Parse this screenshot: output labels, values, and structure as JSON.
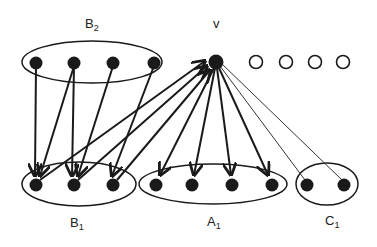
{
  "diagram": {
    "type": "directed-graph",
    "colors": {
      "stroke": "#1a1a1a",
      "filled_node": "#1a1a1a",
      "open_node": "#ffffff",
      "background": "#ffffff"
    },
    "labels": {
      "v": "v",
      "B2": {
        "base": "B",
        "sub": "2"
      },
      "B1": {
        "base": "B",
        "sub": "1"
      },
      "A1": {
        "base": "A",
        "sub": "1"
      },
      "C1": {
        "base": "C",
        "sub": "1"
      }
    },
    "groups": [
      {
        "name": "B2",
        "nodes": [
          "b2_1",
          "b2_2",
          "b2_3",
          "b2_4"
        ]
      },
      {
        "name": "B1",
        "nodes": [
          "b1_1",
          "b1_2",
          "b1_3"
        ]
      },
      {
        "name": "A1",
        "nodes": [
          "a1_1",
          "a1_2",
          "a1_3",
          "a1_4"
        ]
      },
      {
        "name": "C1",
        "nodes": [
          "c1_1",
          "c1_2"
        ]
      }
    ],
    "nodes": {
      "v": "filled",
      "open_nodes": [
        "o1",
        "o2",
        "o3",
        "o4"
      ]
    },
    "edges": [
      {
        "from": "b2_1",
        "to": "b1_1",
        "style": "arrow"
      },
      {
        "from": "b2_2",
        "to": "b1_1",
        "style": "arrow"
      },
      {
        "from": "b2_2",
        "to": "b1_2",
        "style": "arrow"
      },
      {
        "from": "b2_3",
        "to": "b1_2",
        "style": "arrow"
      },
      {
        "from": "b2_4",
        "to": "b1_3",
        "style": "arrow"
      },
      {
        "from": "b1_1",
        "to": "v",
        "style": "arrow"
      },
      {
        "from": "b1_2",
        "to": "v",
        "style": "arrow"
      },
      {
        "from": "b1_3",
        "to": "v",
        "style": "arrow"
      },
      {
        "from": "v",
        "to": "a1_1",
        "style": "arrow"
      },
      {
        "from": "v",
        "to": "a1_2",
        "style": "arrow"
      },
      {
        "from": "v",
        "to": "a1_3",
        "style": "arrow"
      },
      {
        "from": "v",
        "to": "a1_4",
        "style": "arrow"
      },
      {
        "from": "v",
        "to": "c1_1",
        "style": "thin"
      },
      {
        "from": "v",
        "to": "c1_2",
        "style": "thin"
      }
    ]
  }
}
